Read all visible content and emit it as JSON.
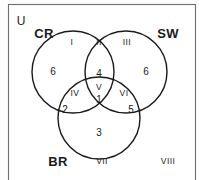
{
  "diagram": {
    "universe_label": "U",
    "frame": {
      "x": 8,
      "y": 4,
      "width": 188,
      "height": 178,
      "stroke": "#6e6e6e"
    },
    "stroke_color": "#1a1a1a",
    "background": "#ffffff"
  },
  "sets": [
    {
      "key": "cr",
      "label": "CR",
      "cx": 73,
      "cy": 72,
      "r": 41,
      "label_x": 44,
      "label_y": 33
    },
    {
      "key": "sw",
      "label": "SW",
      "cx": 126,
      "cy": 72,
      "r": 41,
      "label_x": 168,
      "label_y": 33
    },
    {
      "key": "br",
      "label": "BR",
      "cx": 99,
      "cy": 118,
      "r": 41,
      "label_x": 58,
      "label_y": 161
    }
  ],
  "regions": [
    {
      "key": "I",
      "roman": "I",
      "x": 72,
      "y": 42,
      "region": "CR only"
    },
    {
      "key": "II",
      "roman": "II",
      "x": 99,
      "y": 42,
      "region": "CR and SW"
    },
    {
      "key": "III",
      "roman": "III",
      "x": 127,
      "y": 42,
      "region": "SW only"
    },
    {
      "key": "IV",
      "roman": "IV",
      "x": 75,
      "y": 93,
      "region": "CR and BR"
    },
    {
      "key": "V",
      "roman": "V",
      "x": 99,
      "y": 87,
      "region": "CR and SW and BR"
    },
    {
      "key": "VI",
      "roman": "VI",
      "x": 124,
      "y": 93,
      "region": "SW and BR"
    },
    {
      "key": "VII",
      "roman": "VII",
      "x": 102,
      "y": 161,
      "region": "BR only"
    },
    {
      "key": "VIII",
      "roman": "VIII",
      "x": 168,
      "y": 161,
      "region": "outside all sets"
    }
  ],
  "counts": [
    {
      "key": "cr_only",
      "value": "6",
      "x": 53,
      "y": 72
    },
    {
      "key": "cr_sw_only",
      "value": "4",
      "x": 99,
      "y": 74
    },
    {
      "key": "sw_only",
      "value": "6",
      "x": 146,
      "y": 72
    },
    {
      "key": "center",
      "value": "1",
      "x": 99,
      "y": 100
    },
    {
      "key": "cr_br_only",
      "value": "2",
      "x": 65,
      "y": 110
    },
    {
      "key": "sw_br_only",
      "value": "5",
      "x": 131,
      "y": 110
    },
    {
      "key": "br_only_top",
      "value": "3",
      "x": 99,
      "y": 133
    }
  ]
}
